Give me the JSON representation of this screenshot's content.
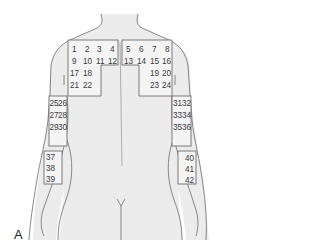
{
  "figure": {
    "panel_label": "A",
    "view": "posterior upper body",
    "colors": {
      "skin": "#e9e9e9",
      "outline": "#7a7a7a",
      "box": "#6e6e6e",
      "text": "#3a3a3a",
      "background": "#ffffff"
    }
  },
  "regions": {
    "left_back": {
      "rows": [
        [
          "1",
          "2",
          "3",
          "4"
        ],
        [
          "9",
          "10",
          "11",
          "12"
        ],
        [
          "17",
          "18"
        ],
        [
          "21",
          "22"
        ]
      ]
    },
    "right_back": {
      "rows": [
        [
          "5",
          "6",
          "7",
          "8"
        ],
        [
          "13",
          "14",
          "15",
          "16"
        ],
        [
          "19",
          "20"
        ],
        [
          "23",
          "24"
        ]
      ]
    },
    "left_upper_arm": {
      "rows": [
        [
          "25",
          "26"
        ],
        [
          "27",
          "28"
        ],
        [
          "29",
          "30"
        ]
      ]
    },
    "right_upper_arm": {
      "rows": [
        [
          "31",
          "32"
        ],
        [
          "33",
          "34"
        ],
        [
          "35",
          "36"
        ]
      ]
    },
    "left_forearm": {
      "rows": [
        [
          "37"
        ],
        [
          "38"
        ],
        [
          "39"
        ]
      ]
    },
    "right_forearm": {
      "rows": [
        [
          "40"
        ],
        [
          "41"
        ],
        [
          "42"
        ]
      ]
    }
  }
}
